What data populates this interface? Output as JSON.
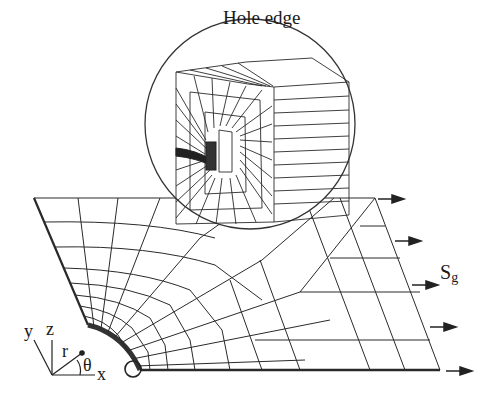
{
  "figure": {
    "inset_title": "Hole edge",
    "load_label": "S",
    "load_label_sub": "g",
    "axes": {
      "y": "y",
      "z": "z",
      "r": "r",
      "theta": "θ",
      "x": "x"
    }
  },
  "colors": {
    "line": "#2a2a2a",
    "background": "#ffffff"
  },
  "icons": {
    "load_arrows": "arrow-right-icon",
    "hole_marker": "circle-icon"
  }
}
